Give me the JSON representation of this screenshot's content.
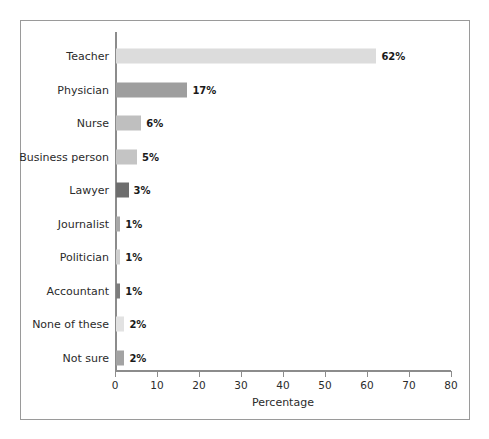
{
  "chart_data": {
    "type": "bar",
    "orientation": "horizontal",
    "title": "",
    "xlabel": "Percentage",
    "ylabel": "",
    "xlim": [
      0,
      80
    ],
    "ylim": null,
    "grid": false,
    "legend": null,
    "xticks": [
      "0",
      "10",
      "20",
      "30",
      "40",
      "50",
      "60",
      "70",
      "80"
    ],
    "xtick_values": [
      0,
      10,
      20,
      30,
      40,
      50,
      60,
      70,
      80
    ],
    "categories": [
      "Teacher",
      "Physician",
      "Nurse",
      "Business person",
      "Lawyer",
      "Journalist",
      "Politician",
      "Accountant",
      "None of these",
      "Not sure"
    ],
    "values": [
      62,
      17,
      6,
      5,
      3,
      1,
      1,
      1,
      2,
      2
    ],
    "data_labels": [
      "62%",
      "17%",
      "6%",
      "5%",
      "3%",
      "1%",
      "1%",
      "1%",
      "2%",
      "2%"
    ],
    "bar_colors": [
      "#dcdcdc",
      "#9e9e9e",
      "#bfbfbf",
      "#c4c4c4",
      "#6e6e6e",
      "#a8a8a8",
      "#cfcfcf",
      "#7d7d7d",
      "#e2e2e2",
      "#a3a3a3"
    ]
  },
  "figure": {
    "background_color": "#ffffff",
    "border_color": "#9a9a9a",
    "axis_color": "#8c8c8c",
    "text_color": "#2b2b2b"
  }
}
